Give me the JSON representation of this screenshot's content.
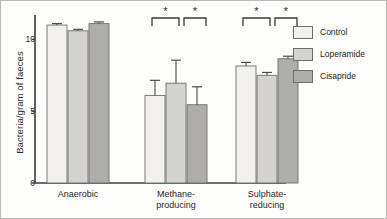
{
  "figure": {
    "border_color": "#b9b9b6",
    "background": "#fdfdfc"
  },
  "chart_data": {
    "type": "bar",
    "title": "",
    "subtitle": "",
    "xlabel": "",
    "ylabel": "Bacteria/gram of faeces",
    "categories": [
      "Anaerobic",
      "Methane-\nproducing",
      "Sulphate-\nreducing"
    ],
    "ylim": [
      0,
      11.7
    ],
    "yticks": [
      0,
      5,
      10
    ],
    "ytick_labels": [
      "0",
      "5",
      "10"
    ],
    "grid": false,
    "legend_position": "right",
    "series": [
      {
        "name": "Control",
        "color": "#f1f0ee",
        "edge": "#6d6d6b",
        "values": [
          11.0,
          6.1,
          8.15
        ],
        "errors": [
          0.1,
          1.05,
          0.25
        ]
      },
      {
        "name": "Loperamide",
        "color": "#d4d3d0",
        "edge": "#6d6d6b",
        "values": [
          10.6,
          6.95,
          7.5
        ],
        "errors": [
          0.1,
          1.6,
          0.2
        ]
      },
      {
        "name": "Cisapride",
        "color": "#aeadab",
        "edge": "#6d6d6b",
        "values": [
          11.1,
          5.45,
          8.65
        ],
        "errors": [
          0.12,
          1.25,
          0.18
        ]
      }
    ],
    "annotations": [
      {
        "label": "*",
        "group": "Methane-producing",
        "between": [
          "Control",
          "Loperamide"
        ]
      },
      {
        "label": "*",
        "group": "Methane-producing",
        "between": [
          "Loperamide",
          "Cisapride"
        ]
      },
      {
        "label": "*",
        "group": "Sulphate-reducing",
        "between": [
          "Control",
          "Loperamide"
        ]
      },
      {
        "label": "*",
        "group": "Sulphate-reducing",
        "between": [
          "Loperamide",
          "Cisapride"
        ]
      }
    ]
  },
  "legend": {
    "items": [
      {
        "label": "Control",
        "color": "#f1f0ee"
      },
      {
        "label": "Loperamide",
        "color": "#d4d3d0"
      },
      {
        "label": "Cisapride",
        "color": "#aeadab"
      }
    ]
  },
  "axis": {
    "y_title": "Bacteria/gram of faeces",
    "tick_0": "0",
    "tick_5": "5",
    "tick_10": "10"
  },
  "xlabels": {
    "g0": "Anaerobic",
    "g1": "Methane-\nproducing",
    "g2": "Sulphate-\nreducing"
  },
  "significance": {
    "star": "*"
  }
}
